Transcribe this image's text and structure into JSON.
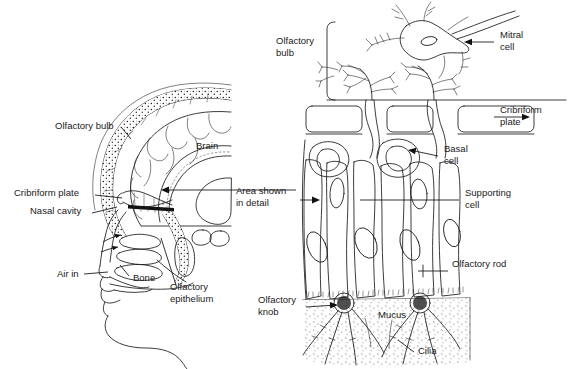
{
  "figure": {
    "background": "#ffffff",
    "ink_color": "#1a1a1a",
    "width": 578,
    "height": 369
  },
  "left_panel": {
    "name": "head-sagittal-section",
    "labels": [
      {
        "id": "olfactory-bulb",
        "text": "Olfactory bulb",
        "x": 55,
        "y": 129
      },
      {
        "id": "brain",
        "text": "Brain",
        "x": 196,
        "y": 149
      },
      {
        "id": "cribriform-plate",
        "text": "Cribriform plate",
        "x": 14,
        "y": 196
      },
      {
        "id": "nasal-cavity",
        "text": "Nasal cavity",
        "x": 30,
        "y": 214
      },
      {
        "id": "air-in",
        "text": "Air in",
        "x": 57,
        "y": 277
      },
      {
        "id": "bone",
        "text": "Bone",
        "x": 133,
        "y": 281
      },
      {
        "id": "olfactory-epithelium-line1",
        "text": "Olfactory",
        "x": 170,
        "y": 290
      },
      {
        "id": "olfactory-epithelium-line2",
        "text": "epithelium",
        "x": 170,
        "y": 302
      }
    ]
  },
  "connector": {
    "name": "area-shown-in-detail",
    "line1": "Area shown",
    "line2": "in detail",
    "x": 236,
    "y": 194
  },
  "right_panel": {
    "name": "olfactory-epithelium-detail",
    "labels": [
      {
        "id": "olfactory-bulb",
        "line1": "Olfactory",
        "line2": "bulb",
        "x": 276,
        "y": 44
      },
      {
        "id": "mitral-cell",
        "line1": "Mitral",
        "line2": "cell",
        "x": 500,
        "y": 38
      },
      {
        "id": "cribriform-plate",
        "line1": "Cribriform",
        "line2": "plate",
        "x": 500,
        "y": 113
      },
      {
        "id": "basal-cell",
        "line1": "Basal",
        "line2": "cell",
        "x": 444,
        "y": 152
      },
      {
        "id": "supporting-cell",
        "line1": "Supporting",
        "line2": "cell",
        "x": 465,
        "y": 196
      },
      {
        "id": "olfactory-rod",
        "line1": "Olfactory rod",
        "line2": "",
        "x": 452,
        "y": 267
      },
      {
        "id": "olfactory-knob",
        "line1": "Olfactory",
        "line2": "knob",
        "x": 258,
        "y": 303
      },
      {
        "id": "mucus",
        "line1": "Mucus",
        "line2": "",
        "x": 378,
        "y": 318
      },
      {
        "id": "cilia",
        "line1": "Cilia",
        "line2": "",
        "x": 418,
        "y": 354
      }
    ]
  }
}
